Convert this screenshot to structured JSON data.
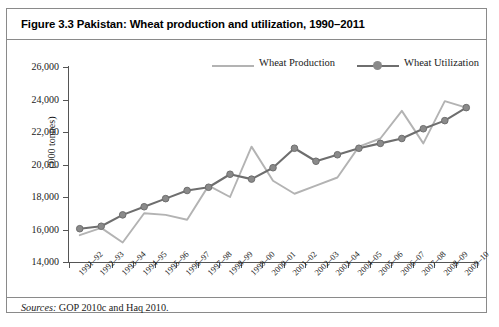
{
  "figure": {
    "title": "Figure 3.3 Pakistan: Wheat production and utilization, 1990–2011",
    "source_prefix": "Sources:",
    "source_text": "GOP 2010c and Haq 2010."
  },
  "legend": {
    "position": "top-right",
    "items": [
      {
        "label": "Wheat Production",
        "color": "#b3b3b3",
        "marker": false
      },
      {
        "label": "Wheat Utilization",
        "color": "#6e6e6e",
        "marker": true
      }
    ]
  },
  "chart_data": {
    "type": "line",
    "title": "Figure 3.3 Pakistan: Wheat production and utilization, 1990–2011",
    "xlabel": "",
    "ylabel": "('000 tonnes)",
    "ylim": [
      14000,
      26000
    ],
    "ytick_step": 2000,
    "ytick_labels": [
      "26,000",
      "24,000",
      "22,000",
      "20,000",
      "18,000",
      "16,000",
      "14,000"
    ],
    "ytick_values": [
      26000,
      24000,
      22000,
      20000,
      18000,
      16000,
      14000
    ],
    "grid": false,
    "legend_position": "top-right",
    "categories": [
      "1991–92",
      "1992–93",
      "1993–94",
      "1994–95",
      "1995–96",
      "1996–97",
      "1997–98",
      "1998–99",
      "1999–00",
      "2000–01",
      "2001–02",
      "2002–03",
      "2003–04",
      "2004–05",
      "2005–06",
      "2006–07",
      "2007–08",
      "2008–09",
      "2009–10"
    ],
    "series": [
      {
        "name": "Wheat Production",
        "color": "#b3b3b3",
        "marker": false,
        "values": [
          15650,
          16100,
          15200,
          17000,
          16900,
          16600,
          18700,
          18000,
          21100,
          19000,
          18200,
          18700,
          19200,
          21100,
          21600,
          23300,
          21300,
          23900,
          23500
        ]
      },
      {
        "name": "Wheat Utilization",
        "color": "#6e6e6e",
        "marker": true,
        "values": [
          16050,
          16200,
          16900,
          17400,
          17900,
          18400,
          18600,
          19400,
          19100,
          19800,
          21000,
          20200,
          20600,
          21000,
          21300,
          21600,
          22200,
          22700,
          23500
        ]
      }
    ]
  }
}
